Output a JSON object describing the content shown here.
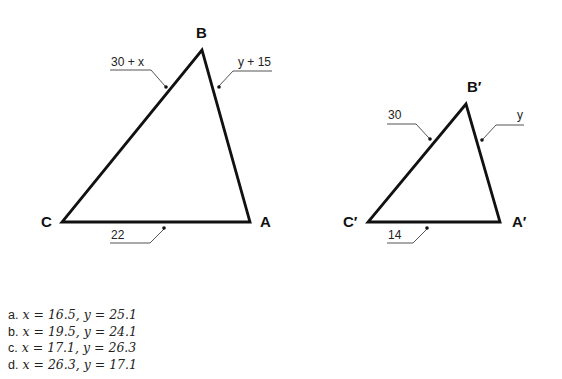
{
  "figure": {
    "large_triangle": {
      "vertices": {
        "A": "A",
        "B": "B",
        "C": "C"
      },
      "sides": {
        "CB": "30 + x",
        "BA": "y + 15",
        "CA": "22"
      }
    },
    "small_triangle": {
      "vertices": {
        "A": "A′",
        "B": "B′",
        "C": "C′"
      },
      "sides": {
        "CB": "30",
        "BA": "y",
        "CA": "14"
      }
    }
  },
  "choices": [
    {
      "letter": "a.",
      "x": "x = 16.5,",
      "y": "y = 25.1"
    },
    {
      "letter": "b.",
      "x": "x = 19.5,",
      "y": "y = 24.1"
    },
    {
      "letter": "c.",
      "x": "x = 17.1,",
      "y": "y = 26.3"
    },
    {
      "letter": "d.",
      "x": "x = 26.3,",
      "y": "y = 17.1"
    }
  ]
}
